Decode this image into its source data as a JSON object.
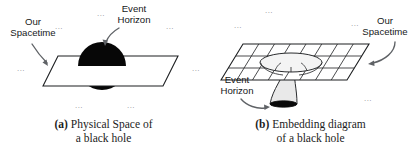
{
  "figure": {
    "type": "two-panel scientific illustration",
    "background_color": "#ffffff",
    "ink_color": "#1d1f21",
    "arrow_color": "#5f6266",
    "ellipsis_color": "#8d9095"
  },
  "panel_a": {
    "caption_tag": "(a)",
    "caption_line1": "Physical Space of",
    "caption_line2": "a black hole",
    "labels": {
      "spacetime_line1": "Our",
      "spacetime_line2": "Spacetime",
      "horizon_line1": "Event",
      "horizon_line2": "Horizon"
    },
    "ellipses": [
      "...",
      "...",
      "...",
      "...",
      "...",
      "...",
      "..."
    ],
    "elements": {
      "plane_name": "our-spacetime-plane",
      "sphere_name": "event-horizon-sphere",
      "sphere_color": "#070707"
    }
  },
  "panel_b": {
    "caption_tag": "(b)",
    "caption_line1": "Embedding diagram",
    "caption_line2": "of a black hole",
    "labels": {
      "spacetime_line1": "Our",
      "spacetime_line2": "Spacetime",
      "horizon_line1": "Event",
      "horizon_line2": "Horizon"
    },
    "ellipses": [
      "...",
      "...",
      "...",
      "..."
    ],
    "grid": {
      "columns": 8,
      "rows": 3,
      "funnel_color": "#e9e9e9",
      "horizon_disc_color": "#0a0a0a"
    }
  }
}
